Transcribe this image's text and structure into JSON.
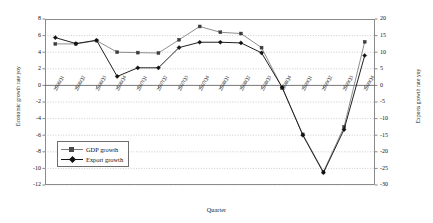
{
  "chart_data": {
    "type": "line",
    "title": "",
    "xlabel": "Quarter",
    "ylabel": "Economic growth rate yoy",
    "ylabel_right": "Exports growth rate yoy",
    "grid": true,
    "legend_position": "inside-lower-left",
    "ylim": [
      -12,
      8
    ],
    "yticks": [
      8,
      6,
      4,
      2,
      0,
      -2,
      -4,
      -6,
      -8,
      -10,
      -12
    ],
    "ylim_right": [
      -30,
      20
    ],
    "yticks_right": [
      20,
      15,
      10,
      5,
      0,
      -5,
      -10,
      -15,
      -20,
      -25,
      -30
    ],
    "categories": [
      "2006Q1",
      "2006Q2",
      "2006Q3",
      "2006Q4",
      "2007Q1",
      "2007Q2",
      "2007Q3",
      "2007Q4",
      "2008Q1",
      "2008Q2",
      "2008Q3",
      "2008Q4",
      "2009Q1",
      "2009Q2",
      "2009Q3",
      "2009Q4"
    ],
    "series": [
      {
        "name": "GDP growth",
        "axis": "left",
        "marker": "square",
        "color": "#7a7a7a",
        "values": [
          5.0,
          5.0,
          5.4,
          4.0,
          3.95,
          3.9,
          5.5,
          7.1,
          6.4,
          6.25,
          4.55,
          -0.3,
          -5.9,
          -10.4,
          -5.0,
          5.25
        ]
      },
      {
        "name": "Export growth",
        "axis": "right",
        "marker": "diamond",
        "color": "#151515",
        "values": [
          14.4,
          12.6,
          13.6,
          2.7,
          5.3,
          5.3,
          11.4,
          13.0,
          13.0,
          12.8,
          9.8,
          -0.6,
          -15.0,
          -26.3,
          -13.3,
          9.0
        ]
      }
    ]
  },
  "legend": {
    "items": [
      {
        "label": "GDP growth"
      },
      {
        "label": "Export growth"
      }
    ]
  }
}
